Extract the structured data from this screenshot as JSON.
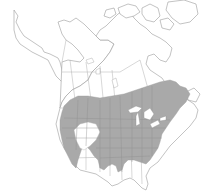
{
  "map": {
    "region": "North America",
    "type": "species range map",
    "colors": {
      "background": "#ffffff",
      "land": "#ffffff",
      "outline": "#9a9a9a",
      "range": "#a9a9a9",
      "lakes": "#ffffff"
    },
    "range_description": "Shaded range across southern Canada and northern/central United States, from Pacific Northwest to Atlantic provinces, south to Oklahoma, Arkansas, Tennessee and Carolinas"
  }
}
